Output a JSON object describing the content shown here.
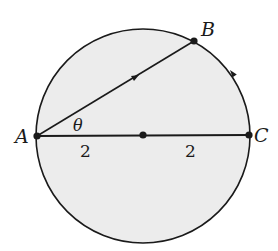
{
  "diagram": {
    "colors": {
      "fill": "#ececec",
      "stroke": "#1a1a1a",
      "background": "#ffffff"
    },
    "circle": {
      "cx": 143,
      "cy": 136,
      "r": 107
    },
    "points": {
      "A": {
        "label": "A",
        "x": 37,
        "y": 136
      },
      "B": {
        "label": "B",
        "x": 194,
        "y": 41
      },
      "C": {
        "label": "C",
        "x": 249,
        "y": 135
      },
      "O": {
        "label": "",
        "x": 143,
        "y": 135
      }
    },
    "angle_label": "θ",
    "segment_labels": {
      "left": "2",
      "right": "2"
    }
  }
}
